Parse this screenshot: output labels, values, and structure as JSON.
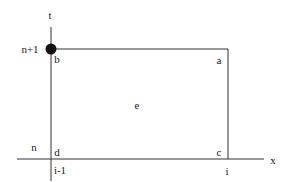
{
  "diagram": {
    "type": "finite-difference-grid-cell",
    "axes": {
      "vertical_label": "t",
      "horizontal_label": "x"
    },
    "grid_ticks": {
      "t_upper": "n+1",
      "t_lower": "n",
      "x_left": "i-1",
      "x_right": "i"
    },
    "corners": {
      "top_right": "a",
      "top_left": "b",
      "bottom_right": "c",
      "bottom_left": "d"
    },
    "center": "e",
    "marked_point": {
      "at_corner": "b",
      "style": "filled-circle"
    },
    "colors": {
      "line": "#333333",
      "text": "#1a1a1a",
      "dot": "#111111",
      "background": "#ffffff"
    }
  }
}
